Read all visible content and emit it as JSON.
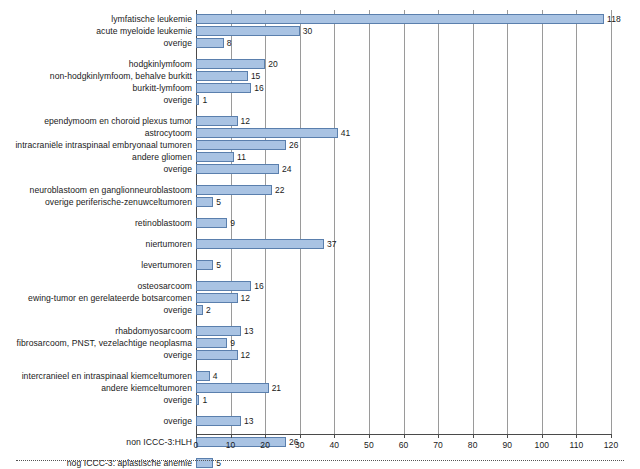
{
  "chart_data": {
    "type": "bar",
    "orientation": "horizontal",
    "title": "",
    "xlabel": "",
    "ylabel": "",
    "xlim": [
      0,
      120
    ],
    "xticks": [
      0,
      10,
      20,
      30,
      40,
      50,
      60,
      70,
      80,
      90,
      100,
      110,
      120
    ],
    "xtick_labels": [
      "0",
      "10",
      "20",
      "30",
      "40",
      "50",
      "60",
      "70",
      "80",
      "90",
      "100",
      "110",
      "120"
    ],
    "grid": true,
    "grid_axis": "x",
    "legend": "none",
    "bar_fill_color": "#a9c3e3",
    "bar_edge_color": "#5a7fad",
    "groups": [
      {
        "name": "leukemie",
        "items": [
          {
            "label": "lymfatische leukemie",
            "value": 118
          },
          {
            "label": "acute myeloide leukemie",
            "value": 30
          },
          {
            "label": "overige",
            "value": 8
          }
        ]
      },
      {
        "name": "lymfomen",
        "items": [
          {
            "label": "hodgkinlymfoom",
            "value": 20
          },
          {
            "label": "non-hodgkinlymfoom, behalve burkitt",
            "value": 15
          },
          {
            "label": "burkitt-lymfoom",
            "value": 16
          },
          {
            "label": "overige",
            "value": 1
          }
        ]
      },
      {
        "name": "cns-tumoren",
        "items": [
          {
            "label": "ependymoom en choroid plexus tumor",
            "value": 12
          },
          {
            "label": "astrocytoom",
            "value": 41
          },
          {
            "label": "intracraniële intraspinaal embryonaal tumoren",
            "value": 26
          },
          {
            "label": "andere gliomen",
            "value": 11
          },
          {
            "label": "overige",
            "value": 24
          }
        ]
      },
      {
        "name": "neuroblastoom",
        "items": [
          {
            "label": "neuroblastoom en ganglionneuroblastoom",
            "value": 22
          },
          {
            "label": "overige periferische-zenuwceltumoren",
            "value": 5
          }
        ]
      },
      {
        "name": "retinoblastoom",
        "items": [
          {
            "label": "retinoblastoom",
            "value": 9
          }
        ]
      },
      {
        "name": "niertumoren",
        "items": [
          {
            "label": "niertumoren",
            "value": 37
          }
        ]
      },
      {
        "name": "levertumoren",
        "items": [
          {
            "label": "levertumoren",
            "value": 5
          }
        ]
      },
      {
        "name": "bottumoren",
        "items": [
          {
            "label": "osteosarcoom",
            "value": 16
          },
          {
            "label": "ewing-tumor en gerelateerde botsarcomen",
            "value": 12
          },
          {
            "label": "overige",
            "value": 2
          }
        ]
      },
      {
        "name": "wekedelentumoren",
        "items": [
          {
            "label": "rhabdomyosarcoom",
            "value": 13
          },
          {
            "label": "fibrosarcoom, PNST, vezelachtige neoplasma",
            "value": 9
          },
          {
            "label": "overige",
            "value": 12
          }
        ]
      },
      {
        "name": "kiemceltumoren",
        "items": [
          {
            "label": "intercranieel en intraspinaal kiemceltumoren",
            "value": 4
          },
          {
            "label": "andere kiemceltumoren",
            "value": 21
          },
          {
            "label": "overige",
            "value": 1
          }
        ]
      },
      {
        "name": "overige-tumoren",
        "items": [
          {
            "label": "overige",
            "value": 13
          }
        ]
      },
      {
        "name": "non-iccc",
        "items": [
          {
            "label": "non ICCC-3:HLH",
            "value": 26
          }
        ]
      },
      {
        "name": "nog-iccc",
        "items": [
          {
            "label": "nog ICCC-3: aplastische anemie",
            "value": 5
          }
        ]
      }
    ]
  }
}
